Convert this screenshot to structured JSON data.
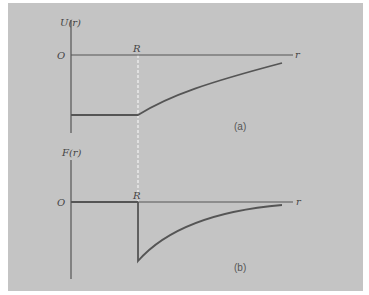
{
  "figure": {
    "background": "#c4c4c4",
    "line_color": "#555555",
    "marker_color": "#ffffff",
    "panels": [
      {
        "id": "a",
        "caption": "(a)",
        "y_label": "U(r)",
        "origin_label": "O",
        "x_label": "r",
        "marker_label": "R",
        "description": "Potential energy: constant negative value for r < R, rising toward zero for r > R"
      },
      {
        "id": "b",
        "caption": "(b)",
        "y_label": "F(r)",
        "origin_label": "O",
        "x_label": "r",
        "marker_label": "R",
        "description": "Force: zero for r < R, sharp negative jump at r = R, then decaying toward zero"
      }
    ]
  }
}
